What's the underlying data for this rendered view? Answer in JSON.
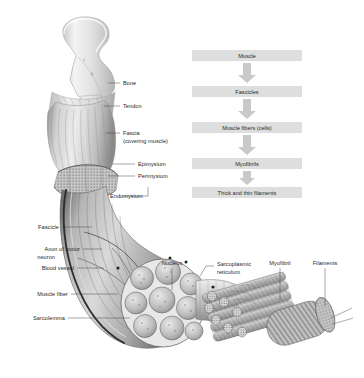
{
  "figure": {
    "background_color": "#ffffff",
    "label_color": "#262626"
  },
  "flowchart": {
    "box_color": "#dedede",
    "arrow_color": "#c9c9c9",
    "orientation": "vertical",
    "steps": [
      {
        "label": "Muscle"
      },
      {
        "label": "Fascicles"
      },
      {
        "label": "Muscle fibers (cells)"
      },
      {
        "label": "Myofibrils"
      },
      {
        "label": "Thick and thin filaments"
      }
    ]
  },
  "anatomy_labels": {
    "right_of_bone": [
      {
        "name": "bone",
        "label": "Bone"
      },
      {
        "name": "tendon",
        "label": "Tendon"
      },
      {
        "name": "fascia",
        "label": "Fascia"
      },
      {
        "name": "fascia-sub",
        "label": "(covering muscle)"
      },
      {
        "name": "epimysium",
        "label": "Epimysium"
      },
      {
        "name": "perimysium",
        "label": "Perimysium"
      },
      {
        "name": "endomysium",
        "label": "Endomysium"
      }
    ],
    "left_column": [
      {
        "name": "fascicle",
        "label": "Fascicle"
      },
      {
        "name": "axon-line1",
        "label": "Axon of motor"
      },
      {
        "name": "axon-line2",
        "label": "neuron"
      },
      {
        "name": "blood-vessel",
        "label": "Blood vessel"
      },
      {
        "name": "muscle-fiber",
        "label": "Muscle fiber"
      },
      {
        "name": "sarcolemma",
        "label": "Sarcolemma"
      }
    ],
    "lower_right": [
      {
        "name": "nucleus",
        "label": "Nucleus"
      },
      {
        "name": "sarcoplasmic-reticulum-line1",
        "label": "Sarcoplasmic"
      },
      {
        "name": "sarcoplasmic-reticulum-line2",
        "label": "reticulum"
      },
      {
        "name": "myofibril",
        "label": "Myofibril"
      },
      {
        "name": "filaments",
        "label": "Filaments"
      }
    ]
  }
}
